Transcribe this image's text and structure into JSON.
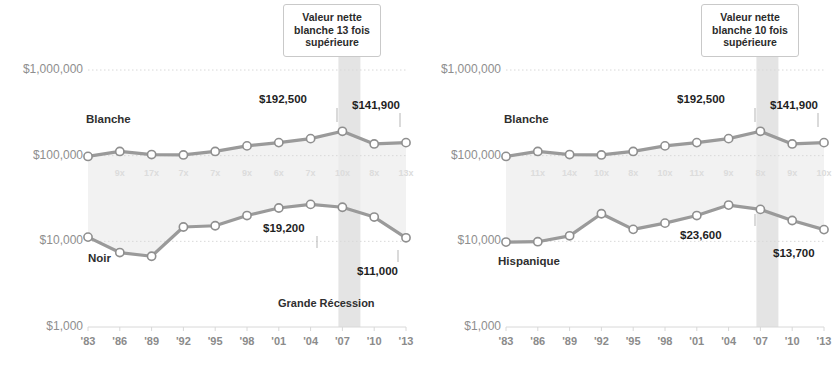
{
  "figure": {
    "recession_label": "Grande Récession",
    "colors": {
      "line": "#9a9a9a",
      "marker_fill": "#ffffff",
      "marker_stroke": "#8f8f8f",
      "band": "#ededed",
      "recession_band": "#e4e4e4",
      "gridline": "#d8d8d8",
      "axis_text": "#8e8e8e",
      "label_text": "#1f1f1f",
      "ratio_text": "#dcdcdc"
    }
  },
  "chart_data": [
    {
      "type": "line",
      "id": "left",
      "title": "",
      "xlabel": "",
      "ylabel": "",
      "log_scale": true,
      "ylim": [
        1000,
        1000000
      ],
      "yticks": [
        1000,
        10000,
        100000,
        1000000
      ],
      "ytick_labels": [
        "$1,000",
        "$10,000",
        "$100,000",
        "$1,000,000"
      ],
      "x": [
        "'83",
        "'86",
        "'89",
        "'92",
        "'95",
        "'98",
        "'01",
        "'04",
        "'07",
        "'10",
        "'13"
      ],
      "grid": true,
      "legend": "inline",
      "annotation": {
        "text": "Valeur nette blanche 13 fois supérieure",
        "lines": [
          "Valeur nette",
          "blanche 13 fois",
          "supérieure"
        ],
        "points_to": "'13"
      },
      "recession_band": {
        "from": "'07",
        "to": "'09",
        "label": "Grande Récession"
      },
      "ratios": [
        "9x",
        "17x",
        "7x",
        "7x",
        "9x",
        "6x",
        "7x",
        "10x",
        "8x",
        "13x"
      ],
      "ratio_note": "Ratio de la valeur nette blanche sur la valeur nette noire",
      "series": [
        {
          "name": "Blanche",
          "values": [
            98000,
            112000,
            103000,
            102000,
            112000,
            130000,
            142000,
            158000,
            192500,
            137000,
            141900
          ],
          "labels": {
            "'07": "$192,500",
            "'13": "$141,900"
          }
        },
        {
          "name": "Noir",
          "values": [
            11200,
            7400,
            6700,
            14700,
            15200,
            20000,
            24500,
            27000,
            25000,
            19200,
            11000
          ],
          "labels": {
            "'10": "$19,200",
            "'13": "$11,000"
          }
        }
      ]
    },
    {
      "type": "line",
      "id": "right",
      "title": "",
      "xlabel": "",
      "ylabel": "",
      "log_scale": true,
      "ylim": [
        1000,
        1000000
      ],
      "yticks": [
        1000,
        10000,
        100000,
        1000000
      ],
      "ytick_labels": [
        "$1,000",
        "$10,000",
        "$100,000",
        "$1,000,000"
      ],
      "x": [
        "'83",
        "'86",
        "'89",
        "'92",
        "'95",
        "'98",
        "'01",
        "'04",
        "'07",
        "'10",
        "'13"
      ],
      "grid": true,
      "legend": "inline",
      "annotation": {
        "text": "Valeur nette blanche 10 fois supérieure",
        "lines": [
          "Valeur nette",
          "blanche 10 fois",
          "supérieure"
        ],
        "points_to": "'13"
      },
      "recession_band": {
        "from": "'07",
        "to": "'09",
        "label": "Grande Récession"
      },
      "ratios": [
        "11x",
        "14x",
        "10x",
        "8x",
        "10x",
        "11x",
        "9x",
        "8x",
        "9x",
        "10x"
      ],
      "ratio_note": "Ratio de la valeur nette blanche sur la valeur nette hispanique",
      "series": [
        {
          "name": "Blanche",
          "values": [
            98000,
            112000,
            103000,
            102000,
            112000,
            130000,
            142000,
            158000,
            192500,
            137000,
            141900
          ],
          "labels": {
            "'07": "$192,500",
            "'13": "$141,900"
          }
        },
        {
          "name": "Hispanique",
          "values": [
            9800,
            9900,
            11600,
            21000,
            13800,
            16300,
            20000,
            26500,
            23600,
            17500,
            13700
          ]
        }
      ],
      "extra_labels": {
        "'07": "$23,600",
        "'13": "$13,700"
      }
    }
  ]
}
